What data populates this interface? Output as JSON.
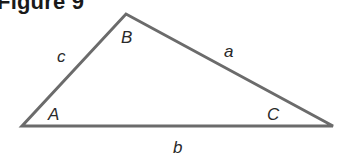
{
  "figure": {
    "title": "Figure 9"
  },
  "diagram": {
    "type": "triangle",
    "stroke_color": "#6b6b6b",
    "vertices": {
      "A": {
        "label": "A",
        "x": 22,
        "y": 126
      },
      "B": {
        "label": "B",
        "x": 126,
        "y": 14
      },
      "C": {
        "label": "C",
        "x": 333,
        "y": 126
      }
    },
    "sides": {
      "a": {
        "label": "a",
        "between": [
          "B",
          "C"
        ]
      },
      "b": {
        "label": "b",
        "between": [
          "A",
          "C"
        ]
      },
      "c": {
        "label": "c",
        "between": [
          "A",
          "B"
        ]
      }
    }
  }
}
